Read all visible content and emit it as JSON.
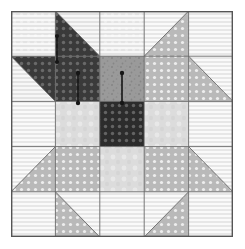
{
  "figure": {
    "kind": "quilt-block-diagram",
    "grid_rows": 5,
    "grid_cols": 5,
    "block_x": 11,
    "block_y": 11,
    "block_width": 222,
    "block_height": 226,
    "border_color": "#555555",
    "seam_line_color": "#6a6a6a",
    "background_color": "#ffffff"
  },
  "palette": {
    "light_white": "#f4f4f4",
    "light_cream": "#ededed",
    "light_gray": "#dcdcdc",
    "medium_gray": "#b4b4b4",
    "medium_dot": "#b9b9b9",
    "mid_texture": "#9a9a9a",
    "dark_charcoal": "#3a3a3a",
    "very_dark": "#2c2c2c",
    "grain_arrow_color": "#161616"
  },
  "legend": {
    "fabrics": [
      {
        "name": "background-light",
        "label": "Light background",
        "color": "#f4f4f4",
        "pattern": "fine-stripe"
      },
      {
        "name": "light-gray-solid",
        "label": "Light gray solid",
        "color": "#dcdcdc",
        "pattern": "mottled"
      },
      {
        "name": "medium-dot",
        "label": "Medium gray dot",
        "color": "#b9b9b9",
        "pattern": "polka-dot"
      },
      {
        "name": "mid-texture",
        "label": "Medium texture",
        "color": "#9a9a9a",
        "pattern": "speckle"
      },
      {
        "name": "dark-dot",
        "label": "Dark charcoal dot",
        "color": "#3a3a3a",
        "pattern": "polka-dot"
      },
      {
        "name": "center-dark",
        "label": "Center dark dot",
        "color": "#2c2c2c",
        "pattern": "polka-dot"
      }
    ]
  },
  "grain_arrows": [
    {
      "name": "grain-arrow-1",
      "cell": "r0c1",
      "cx": 46,
      "cy": 38,
      "length": 26,
      "label": "grainline"
    },
    {
      "name": "grain-arrow-2",
      "cell": "r1c1",
      "cx": 67,
      "cy": 77,
      "length": 30,
      "label": "grainline"
    },
    {
      "name": "grain-arrow-3",
      "cell": "r1c2",
      "cx": 111,
      "cy": 77,
      "length": 30,
      "label": "grainline"
    }
  ],
  "cells": [
    {
      "name": "r0c0",
      "row": 0,
      "col": 0,
      "type": "square",
      "fill": "light_cream"
    },
    {
      "name": "r0c1",
      "row": 0,
      "col": 1,
      "type": "hst",
      "orient": "bl",
      "fill_a": "dark_charcoal",
      "fill_b": "light_cream"
    },
    {
      "name": "r0c2",
      "row": 0,
      "col": 2,
      "type": "square",
      "fill": "light_cream"
    },
    {
      "name": "r0c3",
      "row": 0,
      "col": 3,
      "type": "hst",
      "orient": "br",
      "fill_a": "medium_dot",
      "fill_b": "light_white"
    },
    {
      "name": "r0c4",
      "row": 0,
      "col": 4,
      "type": "square",
      "fill": "light_white"
    },
    {
      "name": "r1c0",
      "row": 1,
      "col": 0,
      "type": "hst",
      "orient": "tr",
      "fill_a": "dark_charcoal",
      "fill_b": "light_cream"
    },
    {
      "name": "r1c1",
      "row": 1,
      "col": 1,
      "type": "square",
      "fill": "dark_charcoal"
    },
    {
      "name": "r1c2",
      "row": 1,
      "col": 2,
      "type": "square",
      "fill": "mid_texture"
    },
    {
      "name": "r1c3",
      "row": 1,
      "col": 3,
      "type": "square",
      "fill": "medium_dot"
    },
    {
      "name": "r1c4",
      "row": 1,
      "col": 4,
      "type": "hst",
      "orient": "tl",
      "fill_a": "medium_dot",
      "fill_b": "light_white"
    },
    {
      "name": "r2c0",
      "row": 2,
      "col": 0,
      "type": "square",
      "fill": "light_white"
    },
    {
      "name": "r2c1",
      "row": 2,
      "col": 1,
      "type": "square",
      "fill": "light_gray"
    },
    {
      "name": "r2c2",
      "row": 2,
      "col": 2,
      "type": "square",
      "fill": "very_dark"
    },
    {
      "name": "r2c3",
      "row": 2,
      "col": 3,
      "type": "square",
      "fill": "light_gray"
    },
    {
      "name": "r2c4",
      "row": 2,
      "col": 4,
      "type": "square",
      "fill": "light_white"
    },
    {
      "name": "r3c0",
      "row": 3,
      "col": 0,
      "type": "hst",
      "orient": "br",
      "fill_a": "medium_dot",
      "fill_b": "light_white"
    },
    {
      "name": "r3c1",
      "row": 3,
      "col": 1,
      "type": "square",
      "fill": "medium_dot"
    },
    {
      "name": "r3c2",
      "row": 3,
      "col": 2,
      "type": "square",
      "fill": "light_gray"
    },
    {
      "name": "r3c3",
      "row": 3,
      "col": 3,
      "type": "square",
      "fill": "medium_dot"
    },
    {
      "name": "r3c4",
      "row": 3,
      "col": 4,
      "type": "hst",
      "orient": "bl",
      "fill_a": "medium_dot",
      "fill_b": "light_white"
    },
    {
      "name": "r4c0",
      "row": 4,
      "col": 0,
      "type": "square",
      "fill": "light_white"
    },
    {
      "name": "r4c1",
      "row": 4,
      "col": 1,
      "type": "hst",
      "orient": "tl",
      "fill_a": "medium_dot",
      "fill_b": "light_white"
    },
    {
      "name": "r4c2",
      "row": 4,
      "col": 2,
      "type": "square",
      "fill": "light_white"
    },
    {
      "name": "r4c3",
      "row": 4,
      "col": 3,
      "type": "hst",
      "orient": "tr",
      "fill_a": "medium_dot",
      "fill_b": "light_white"
    },
    {
      "name": "r4c4",
      "row": 4,
      "col": 4,
      "type": "square",
      "fill": "light_white"
    }
  ]
}
